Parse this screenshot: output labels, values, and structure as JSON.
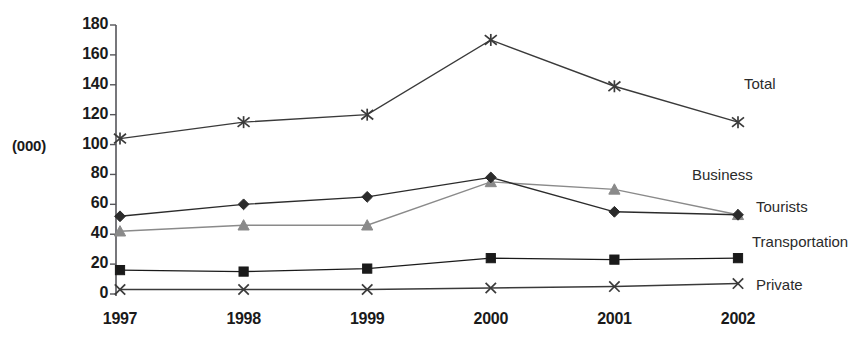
{
  "chart_data": {
    "type": "line",
    "title": "",
    "subtitle": "",
    "xlabel": "",
    "ylabel": "(000)",
    "unit_label": "(000)",
    "categories": [
      "1997",
      "1998",
      "1999",
      "2000",
      "2001",
      "2002"
    ],
    "x": [
      1997,
      1998,
      1999,
      2000,
      2001,
      2002
    ],
    "ylim": [
      0,
      180
    ],
    "xlim": [
      1997,
      2002
    ],
    "ytick_labels": [
      "0",
      "20",
      "40",
      "60",
      "80",
      "100",
      "120",
      "140",
      "160",
      "180"
    ],
    "yticks": [
      0,
      20,
      40,
      60,
      80,
      100,
      120,
      140,
      160,
      180
    ],
    "grid": false,
    "legend_position": "right-inline-labels",
    "series": [
      {
        "name": "Total",
        "label": "Total",
        "marker": "star-asterisk",
        "color": "#3a3a3a",
        "values": [
          104,
          115,
          120,
          170,
          139,
          115
        ]
      },
      {
        "name": "Business",
        "label": "Business",
        "marker": "triangle",
        "color": "#8a8a8a",
        "values": [
          42,
          46,
          46,
          75,
          70,
          53
        ]
      },
      {
        "name": "Tourists",
        "label": "Tourists",
        "marker": "diamond",
        "color": "#2b2b2b",
        "values": [
          52,
          60,
          65,
          78,
          55,
          53
        ]
      },
      {
        "name": "Transportation",
        "label": "Transportation",
        "marker": "square",
        "color": "#1a1a1a",
        "values": [
          16,
          15,
          17,
          24,
          23,
          24
        ]
      },
      {
        "name": "Private",
        "label": "Private",
        "marker": "cross",
        "color": "#3a3a3a",
        "values": [
          3,
          3,
          3,
          4,
          5,
          7
        ]
      }
    ],
    "annotations": [
      {
        "text": "Total",
        "series": "Total"
      },
      {
        "text": "Business",
        "series": "Business"
      },
      {
        "text": "Tourists",
        "series": "Tourists"
      },
      {
        "text": "Transportation",
        "series": "Transportation"
      },
      {
        "text": "Private",
        "series": "Private"
      }
    ],
    "axis_color": "#55555a",
    "background": "#ffffff"
  }
}
